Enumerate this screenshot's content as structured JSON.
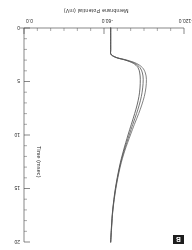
{
  "figure": {
    "panel_label": "B",
    "orientation_note": "rendered rotated 180 degrees"
  },
  "chart_data": {
    "type": "line",
    "title": "",
    "xlabel": "Time (msec)",
    "ylabel": "Membrane Potential (mV)",
    "xlim": [
      0,
      20
    ],
    "ylim": [
      -120.0,
      0.0
    ],
    "grid": false,
    "legend": "none",
    "x_ticks": [
      0,
      5,
      10,
      15,
      20
    ],
    "x_tick_labels": [
      "0",
      "5",
      "10",
      "15",
      "20"
    ],
    "y_ticks": [
      -120.0,
      -60.0,
      0.0
    ],
    "y_tick_labels": [
      "-120.0",
      "-60.0",
      "0.0"
    ],
    "y_minor_ticks": [
      -110,
      -100,
      -90,
      -80,
      -70,
      -50,
      -40,
      -30,
      -20,
      -10
    ],
    "x_minor_ticks": [
      1,
      2,
      3,
      4,
      6,
      7,
      8,
      9,
      11,
      12,
      13,
      14,
      16,
      17,
      18,
      19
    ],
    "series": [
      {
        "name": "trace-1",
        "color": "#3a3a3a",
        "x": [
          0.0,
          1.0,
          2.0,
          2.4,
          2.6,
          2.8,
          3.0,
          3.3,
          3.7,
          4.2,
          4.8,
          5.6,
          6.4,
          7.2,
          8.0,
          9.0,
          10.0,
          11.5,
          13.0,
          15.0,
          17.0,
          18.5,
          20.0
        ],
        "y": [
          -65.0,
          -65.0,
          -65.0,
          -65.0,
          -66.5,
          -70.0,
          -76.0,
          -82.0,
          -85.5,
          -86.8,
          -87.2,
          -87.0,
          -86.2,
          -84.8,
          -83.0,
          -80.5,
          -78.0,
          -74.5,
          -71.5,
          -68.5,
          -66.5,
          -65.6,
          -65.0
        ]
      },
      {
        "name": "trace-2",
        "color": "#4a4a4a",
        "x": [
          0.0,
          1.0,
          2.0,
          2.4,
          2.6,
          2.8,
          3.0,
          3.3,
          3.7,
          4.2,
          4.8,
          5.6,
          6.4,
          7.2,
          8.0,
          9.0,
          10.0,
          11.5,
          13.0,
          15.0,
          17.0,
          18.5,
          20.0
        ],
        "y": [
          -65.0,
          -65.0,
          -65.0,
          -65.0,
          -66.5,
          -70.2,
          -76.5,
          -83.0,
          -87.0,
          -88.8,
          -89.4,
          -89.0,
          -88.0,
          -86.4,
          -84.4,
          -81.6,
          -78.9,
          -75.0,
          -71.8,
          -68.7,
          -66.6,
          -65.7,
          -65.0
        ]
      },
      {
        "name": "trace-3",
        "color": "#5a5a5a",
        "x": [
          0.0,
          1.0,
          2.0,
          2.4,
          2.6,
          2.8,
          3.0,
          3.3,
          3.7,
          4.2,
          4.8,
          5.6,
          6.4,
          7.2,
          8.0,
          9.0,
          10.0,
          11.5,
          13.0,
          15.0,
          17.0,
          18.5,
          20.0
        ],
        "y": [
          -65.0,
          -65.0,
          -65.0,
          -65.0,
          -66.6,
          -70.5,
          -77.2,
          -84.2,
          -88.8,
          -91.0,
          -91.8,
          -91.4,
          -90.2,
          -88.3,
          -86.0,
          -82.8,
          -79.8,
          -75.5,
          -72.1,
          -68.9,
          -66.7,
          -65.8,
          -65.0
        ]
      }
    ]
  }
}
